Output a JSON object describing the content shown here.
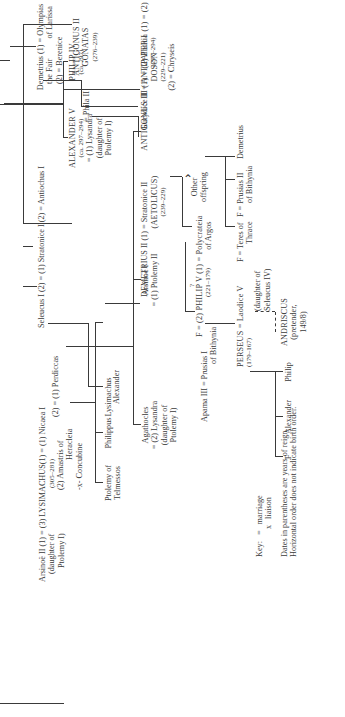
{
  "diagram": {
    "orientation": "rotated 90 degrees counter-clockwise"
  },
  "nodes": {
    "demetrius_fair": {
      "l1": "Demetrius (1) = Olympias",
      "l2": "the Fair",
      "l2b": "of Larissa",
      "l3": "(2) = Berenice"
    },
    "antigonus_iii": {
      "l1": "ANTIGONUS III (1) = (2) Phthia (1) = (2)",
      "l2": "DOSON",
      "l3": "(229–221)",
      "l4": "(2) = Chryseis"
    },
    "antigonus_ii": {
      "l1": "ANTIGONUS II",
      "l2": "GONATAS",
      "l3": "(276–239)",
      "eq": "= Phila II"
    },
    "seleucus": {
      "l1": "Seleucus I (2) = (1) Stratonice I (2) = Antiochus I"
    },
    "demetrius_ii": {
      "l1": "DEMETRIUS II (1) = Stratonice II",
      "l2": "(AETOLICUS)",
      "l3": "(239–229)"
    },
    "other_offspring": {
      "l1": "Other",
      "l2": "offspring"
    },
    "philip_v": {
      "l1": "F = (2) PHILIP V (1) = Polycrateia",
      "l2": "(221–179)",
      "l2b": "of Argos",
      "q": "?"
    },
    "apama": {
      "l1": "Apama III = Prusias I",
      "l2": "of Bithynia"
    },
    "ptolemy_telmessos": {
      "l1": "Ptolemy of",
      "l2": "Telmessos"
    },
    "arsinoe_ii": {
      "l1": "Arsinoë II (1) = (3) LYSIMACHUS(1) = (1) Nicaea I",
      "l2": "(daughter of",
      "l3": "Ptolemy I)"
    },
    "lysimachus": {
      "dates": "(305–281)",
      "w2a": "(2)  Amastris of",
      "w2b": "Heracleia",
      "w3": "-x- Concubine",
      "perdiccas": "(2) = (1) Perdiccas"
    },
    "philippus": {
      "l1": "Philippus"
    },
    "lysimachus_son": {
      "l1": "Lysimachus"
    },
    "alexander_son": {
      "l1": "Alexander"
    },
    "agathocles": {
      "l1": "Agathocles",
      "l2": "= (2) Lysandra",
      "l3": "(daughter of",
      "l4": "Ptolemy I)"
    },
    "arsinoe_i": {
      "l1": "Arsinoë I",
      "l2": "= (1) Ptolemy II"
    },
    "alexander_v": {
      "l1": "ALEXANDER V",
      "l2": "(ca. 297–294)",
      "l3": "= (1) Lysandra",
      "l4": "(daughter of",
      "l5": "Ptolemy I)"
    },
    "philip_iv": {
      "l1": "PHILIP IV",
      "l2": "(ca. 297)"
    },
    "eurydice": {
      "l1": "Eurydice II = ANTIPATER I",
      "l2": "(297–294)"
    },
    "demetrius_son": {
      "l1": "Demetrius"
    },
    "prusias_ii": {
      "l1": "F = Prusias II",
      "l2": "of Bithynia"
    },
    "teres": {
      "l1": "F = Teres of",
      "l2": "Thrace"
    },
    "perseus": {
      "l1": "PERSEUS = Laodice V",
      "l2": "(179–167)",
      "l3": "(daughter of",
      "l4": "Seleucus IV)"
    },
    "andriscus": {
      "l1": "ANDRISCUS",
      "l2": "(pretender,",
      "l3": "149/8)"
    },
    "philip_son": {
      "l1": "Philip"
    },
    "alexander_perseus": {
      "l1": "Alexander"
    },
    "f_daughter": {
      "l1": "F"
    }
  },
  "key": {
    "label": "Key:",
    "marriage_symbol": "=",
    "marriage": "marriage",
    "liaison_symbol": "x",
    "liaison": "liaison",
    "note1": "Dates in parentheses are years of reign.",
    "note2": "Horizontal order does not indicate birth order."
  }
}
